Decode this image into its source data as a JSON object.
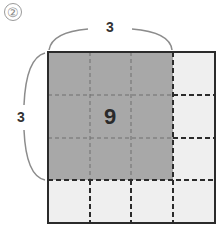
{
  "problem": {
    "number_label": "②"
  },
  "figure": {
    "grid_size": 4,
    "shaded_size": 3,
    "top_brace_label": "3",
    "left_brace_label": "3",
    "shaded_area_label": "9",
    "colors": {
      "shaded": "#a8a8a8",
      "unshaded": "#efefef",
      "border": "#2b2b2b",
      "brace": "#8c8c8c"
    }
  }
}
